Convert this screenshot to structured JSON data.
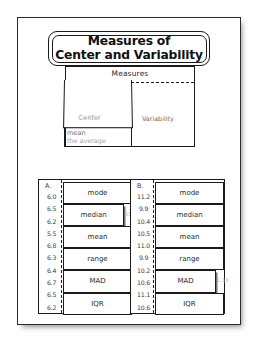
{
  "title": {
    "line1": "Measures of",
    "line2": "Center and Variability"
  },
  "measures_diagram": {
    "header": "Measures",
    "left_label": "Center",
    "right_label": "Variability",
    "under_flap": {
      "ghost_line": "in a data set",
      "line1": "mean",
      "line2": "the average"
    }
  },
  "columns": [
    {
      "letter": "A.",
      "values": [
        "6.0",
        "6.5",
        "6.2",
        "5.5",
        "6.8",
        "6.3",
        "6.4",
        "6.7",
        "6.5",
        "6.2"
      ],
      "flaps": [
        {
          "label": "mode",
          "open": false,
          "ghost": ""
        },
        {
          "label": "median",
          "open": true,
          "ghost": "15"
        },
        {
          "label": "mean",
          "open": false,
          "ghost": ""
        },
        {
          "label": "range",
          "open": false,
          "ghost": ""
        },
        {
          "label": "MAD",
          "open": false,
          "ghost": ""
        },
        {
          "label": "IQR",
          "open": false,
          "ghost": ""
        }
      ]
    },
    {
      "letter": "B.",
      "values": [
        "11.2",
        "9.9",
        "10.4",
        "10.5",
        "11.0",
        "9.9",
        "10.2",
        "10.6",
        "11.1",
        "10.6"
      ],
      "flaps": [
        {
          "label": "mode",
          "open": false,
          "ghost": ""
        },
        {
          "label": "median",
          "open": false,
          "ghost": ""
        },
        {
          "label": "mean",
          "open": false,
          "ghost": ""
        },
        {
          "label": "range",
          "open": false,
          "ghost": ""
        },
        {
          "label": "MAD",
          "open": true,
          "ghost": "1.18"
        },
        {
          "label": "IQR",
          "open": false,
          "ghost": ""
        }
      ]
    }
  ]
}
